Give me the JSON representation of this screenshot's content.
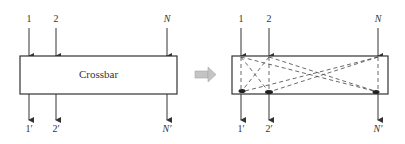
{
  "left_diagram": {
    "box_label": "Crossbar",
    "inputs": [
      "1",
      "2",
      "N"
    ],
    "outputs": [
      "1′",
      "2′",
      "N′"
    ]
  },
  "transition_arrow": {
    "icon": "right-arrow-icon",
    "color": "#b0b0b0"
  },
  "right_diagram": {
    "inputs": [
      "1",
      "2",
      "N"
    ],
    "outputs": [
      "1′",
      "2′",
      "N′"
    ],
    "connections": "dashed crosspoint paths from every input to every output"
  },
  "colors": {
    "line": "#333333",
    "box_fill": "#ffffff"
  }
}
